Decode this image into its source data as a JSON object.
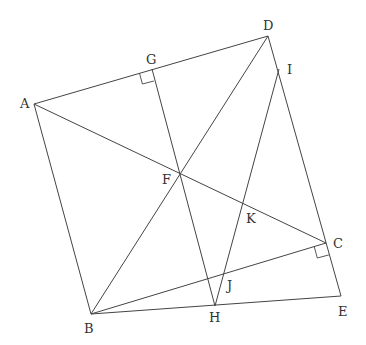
{
  "figure": {
    "type": "geometry-diagram",
    "width": 366,
    "height": 345,
    "stroke_color": "#444444",
    "label_color": "#333333",
    "points": {
      "A": {
        "x": 34,
        "y": 104
      },
      "B": {
        "x": 91,
        "y": 314
      },
      "C": {
        "x": 326,
        "y": 243
      },
      "D": {
        "x": 268,
        "y": 36
      },
      "E": {
        "x": 341,
        "y": 296
      },
      "F": {
        "x": 180,
        "y": 174
      },
      "G": {
        "x": 152,
        "y": 69
      },
      "H": {
        "x": 215,
        "y": 306
      },
      "I": {
        "x": 279,
        "y": 69
      },
      "J": {
        "x": 224,
        "y": 274
      },
      "K": {
        "x": 243,
        "y": 204
      }
    },
    "labels": [
      {
        "name": "A",
        "text": "A",
        "x": 20,
        "y": 108
      },
      {
        "name": "B",
        "text": "B",
        "x": 84,
        "y": 333
      },
      {
        "name": "C",
        "text": "C",
        "x": 333,
        "y": 248
      },
      {
        "name": "D",
        "text": "D",
        "x": 263,
        "y": 30
      },
      {
        "name": "E",
        "text": "E",
        "x": 338,
        "y": 316
      },
      {
        "name": "F",
        "text": "F",
        "x": 162,
        "y": 184
      },
      {
        "name": "G",
        "text": "G",
        "x": 146,
        "y": 64
      },
      {
        "name": "H",
        "text": "H",
        "x": 209,
        "y": 322
      },
      {
        "name": "I",
        "text": "I",
        "x": 287,
        "y": 74
      },
      {
        "name": "J",
        "text": "J",
        "x": 227,
        "y": 290
      },
      {
        "name": "K",
        "text": "K",
        "x": 246,
        "y": 223
      }
    ],
    "segments": [
      [
        "A",
        "D"
      ],
      [
        "A",
        "B"
      ],
      [
        "A",
        "C"
      ],
      [
        "B",
        "D"
      ],
      [
        "B",
        "C"
      ],
      [
        "B",
        "E"
      ],
      [
        "D",
        "E"
      ],
      [
        "G",
        "H"
      ],
      [
        "I",
        "H"
      ]
    ],
    "right_angles": [
      {
        "at": "G",
        "description": "GH perpendicular to AD"
      },
      {
        "at": "C",
        "description": "BC perpendicular to DE"
      }
    ]
  }
}
